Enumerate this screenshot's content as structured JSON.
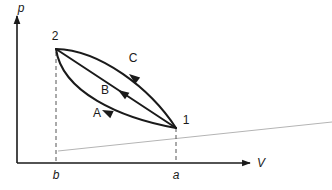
{
  "figure": {
    "kind": "pressure-volume-diagram",
    "background_color": "#ffffff",
    "ink_color": "#1a1a1a",
    "faint_line_color": "#b4b4b4"
  },
  "axes": {
    "y": {
      "label": "p",
      "name": "pressure-axis",
      "x": 17,
      "y_top": 16,
      "y_bottom": 163
    },
    "x": {
      "label": "V",
      "name": "volume-axis",
      "y": 163,
      "x_left": 17,
      "x_right": 250
    }
  },
  "ticks": [
    {
      "label": "b",
      "x": 56,
      "label_x": 56,
      "label_y": 179
    },
    {
      "label": "a",
      "x": 176,
      "label_x": 176,
      "label_y": 179
    }
  ],
  "points": [
    {
      "label": "2",
      "x": 56,
      "y": 49,
      "label_x": 55,
      "label_y": 40
    },
    {
      "label": "1",
      "x": 176,
      "y": 128,
      "label_x": 186,
      "label_y": 124
    }
  ],
  "curves": [
    {
      "label": "C",
      "name": "process-curve-c",
      "path": "M 56 49 C 100 50 150 88 176 128",
      "arrow_at": {
        "x": 129,
        "y": 74,
        "angle": 218
      },
      "label_x": 133,
      "label_y": 62
    },
    {
      "label": "B",
      "name": "process-curve-b",
      "path": "M 56 49 L 176 128",
      "arrow_at": {
        "x": 118,
        "y": 90,
        "angle": 213
      },
      "label_x": 105,
      "label_y": 94
    },
    {
      "label": "A",
      "name": "process-curve-a",
      "path": "M 56 49 C 62 92 120 118 176 128",
      "arrow_at": {
        "x": 102,
        "y": 110,
        "angle": 205
      },
      "label_x": 97,
      "label_y": 117
    }
  ],
  "dashed_guides": [
    {
      "name": "dashed-guide-b",
      "x": 56,
      "y_top": 52,
      "y_bottom": 163
    },
    {
      "name": "dashed-guide-a",
      "x": 176,
      "y_top": 128,
      "y_bottom": 163
    }
  ],
  "faint_line": {
    "name": "faint-reference-line",
    "x1": 58,
    "y1": 151,
    "x2": 332,
    "y2": 122
  }
}
